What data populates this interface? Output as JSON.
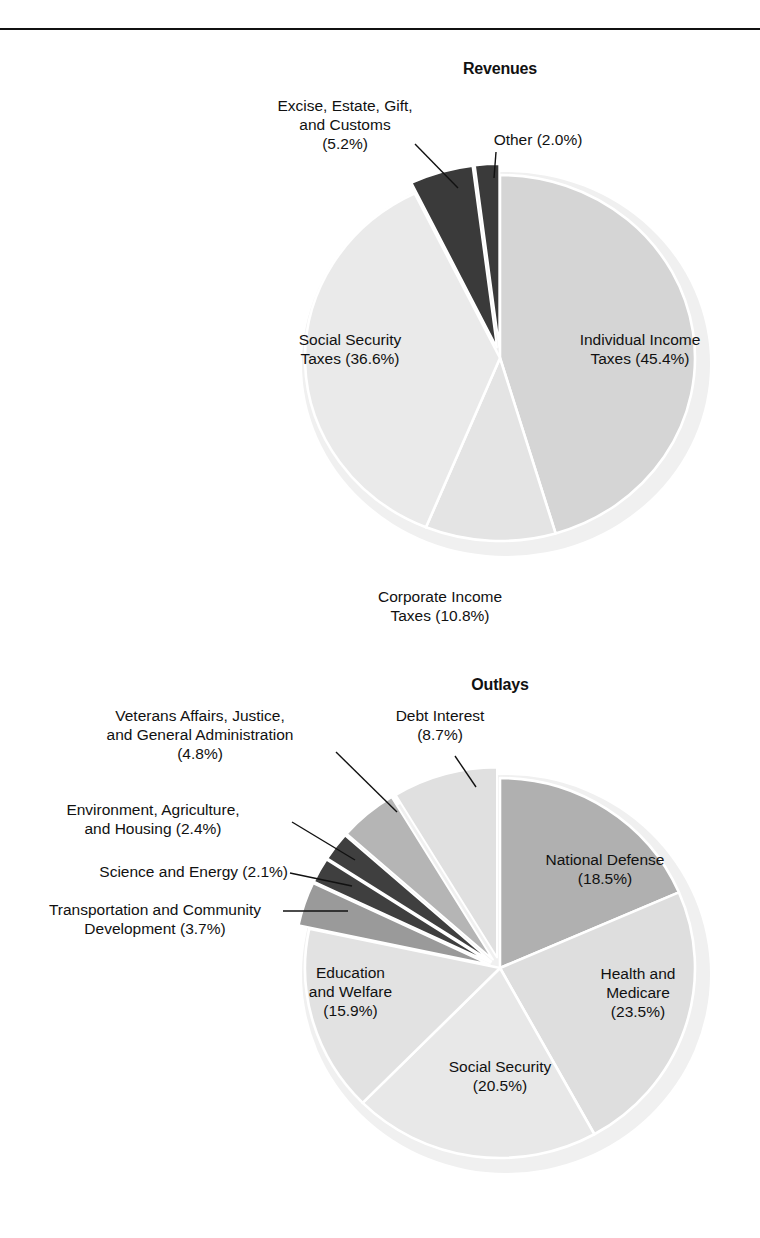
{
  "page": {
    "background": "#ffffff",
    "rule_color": "#111111",
    "text_color": "#111111"
  },
  "charts": [
    {
      "id": "revenues",
      "title": "Revenues",
      "title_pos": {
        "cx": 500,
        "y": 60
      },
      "geometry": {
        "cx": 500,
        "cy": 358,
        "rx": 195,
        "ry": 183,
        "start_angle_deg": -90
      },
      "labels": [
        {
          "name": "individual-income-taxes",
          "text": "Individual Income\nTaxes (45.4%)",
          "x": 535,
          "y": 330,
          "align": "c",
          "width": 210,
          "leader": null
        },
        {
          "name": "social-security-taxes",
          "text": "Social Security\nTaxes (36.6%)",
          "x": 245,
          "y": 330,
          "align": "c",
          "width": 210,
          "leader": null
        },
        {
          "name": "corporate-income-taxes",
          "text": "Corporate Income\nTaxes (10.8%)",
          "x": 330,
          "y": 587,
          "align": "c",
          "width": 220,
          "leader": null
        },
        {
          "name": "excise-estate-gift-customs",
          "text": "Excise, Estate, Gift,\nand Customs\n(5.2%)",
          "x": 230,
          "y": 96,
          "align": "c",
          "width": 230,
          "leader": {
            "x1": 415,
            "y1": 144,
            "x2": 458,
            "y2": 188
          }
        },
        {
          "name": "other",
          "text": "Other (2.0%)",
          "x": 448,
          "y": 130,
          "align": "c",
          "width": 180,
          "leader": {
            "x1": 496,
            "y1": 152,
            "x2": 494,
            "y2": 178
          }
        }
      ]
    },
    {
      "id": "outlays",
      "title": "Outlays",
      "title_pos": {
        "cx": 500,
        "y": 676
      },
      "geometry": {
        "cx": 500,
        "cy": 968,
        "rx": 195,
        "ry": 190,
        "start_angle_deg": -90
      },
      "labels": [
        {
          "name": "national-defense",
          "text": "National Defense\n(18.5%)",
          "x": 500,
          "y": 850,
          "align": "c",
          "width": 210,
          "leader": null
        },
        {
          "name": "health-and-medicare",
          "text": "Health and\nMedicare\n(23.5%)",
          "x": 563,
          "y": 964,
          "align": "c",
          "width": 150,
          "leader": null
        },
        {
          "name": "social-security",
          "text": "Social Security\n(20.5%)",
          "x": 400,
          "y": 1057,
          "align": "c",
          "width": 200,
          "leader": null
        },
        {
          "name": "education-and-welfare",
          "text": "Education\nand Welfare\n(15.9%)",
          "x": 268,
          "y": 963,
          "align": "c",
          "width": 165,
          "leader": null
        },
        {
          "name": "debt-interest",
          "text": "Debt Interest\n(8.7%)",
          "x": 350,
          "y": 706,
          "align": "c",
          "width": 180,
          "leader": {
            "x1": 455,
            "y1": 756,
            "x2": 476,
            "y2": 787
          }
        },
        {
          "name": "veterans-affairs-justice-general-administration",
          "text": "Veterans Affairs, Justice,\nand General Administration\n(4.8%)",
          "x": 55,
          "y": 706,
          "align": "c",
          "width": 290,
          "leader": {
            "x1": 336,
            "y1": 752,
            "x2": 397,
            "y2": 812
          }
        },
        {
          "name": "environment-agriculture-housing",
          "text": "Environment, Agriculture,\nand Housing (2.4%)",
          "x": 18,
          "y": 800,
          "align": "c",
          "width": 270,
          "leader": {
            "x1": 292,
            "y1": 822,
            "x2": 355,
            "y2": 860
          }
        },
        {
          "name": "science-and-energy",
          "text": "Science and Energy (2.1%)",
          "x": 18,
          "y": 862,
          "align": "r",
          "width": 270,
          "leader": {
            "x1": 290,
            "y1": 873,
            "x2": 352,
            "y2": 886
          }
        },
        {
          "name": "transportation-and-community-development",
          "text": "Transportation and Community\nDevelopment (3.7%)",
          "x": 10,
          "y": 900,
          "align": "c",
          "width": 290,
          "leader": {
            "x1": 283,
            "y1": 911,
            "x2": 348,
            "y2": 911
          }
        }
      ]
    }
  ],
  "chart_data": [
    {
      "type": "pie",
      "id": "revenues",
      "title": "Revenues",
      "categories": [
        "Individual Income Taxes",
        "Corporate Income Taxes",
        "Social Security Taxes",
        "Excise, Estate, Gift, and Customs",
        "Other"
      ],
      "values": [
        45.4,
        10.8,
        36.6,
        5.2,
        2.0
      ],
      "units": "percent",
      "colors": [
        "#d5d5d5",
        "#e4e4e4",
        "#eaeaea",
        "#3a3a3a",
        "#3a3a3a"
      ],
      "exploded": [
        false,
        false,
        false,
        true,
        true
      ],
      "start_angle_deg": -90,
      "direction": "clockwise",
      "legend": "labels-on-chart"
    },
    {
      "type": "pie",
      "id": "outlays",
      "title": "Outlays",
      "categories": [
        "National Defense",
        "Health and Medicare",
        "Social Security",
        "Education and Welfare",
        "Transportation and Community Development",
        "Science and Energy",
        "Environment, Agriculture, and Housing",
        "Veterans Affairs, Justice, and General Administration",
        "Debt Interest"
      ],
      "values": [
        18.5,
        23.5,
        20.5,
        15.9,
        3.7,
        2.1,
        2.4,
        4.8,
        8.7
      ],
      "units": "percent",
      "colors": [
        "#b0b0b0",
        "#dedede",
        "#e8e8e8",
        "#e2e2e2",
        "#9a9a9a",
        "#3f3f3f",
        "#3f3f3f",
        "#b5b5b5",
        "#e0e0e0"
      ],
      "exploded": [
        false,
        false,
        false,
        false,
        true,
        true,
        true,
        true,
        true
      ],
      "start_angle_deg": -90,
      "direction": "clockwise",
      "legend": "labels-on-chart"
    }
  ]
}
